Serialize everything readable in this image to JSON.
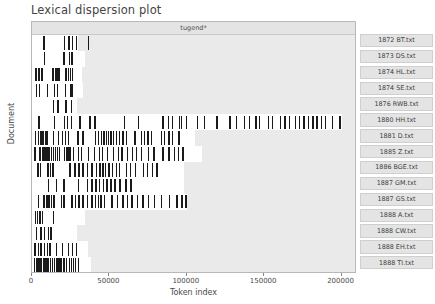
{
  "title": "Lexical dispersion plot",
  "facet": {
    "label": "tugend*"
  },
  "axes": {
    "x_label": "Token index",
    "y_label": "Document",
    "x_ticks": [
      {
        "value": 0,
        "label": "0"
      },
      {
        "value": 50000,
        "label": "50000"
      },
      {
        "value": 100000,
        "label": "100000"
      },
      {
        "value": 150000,
        "label": "150000"
      },
      {
        "value": 200000,
        "label": "200000"
      }
    ],
    "x_min": 0,
    "x_max": 210000
  },
  "colors": {
    "tick": "#1a1a1a",
    "band": "#eaeaea",
    "strip": "#e4e4e4",
    "frame": "#b8b8b8",
    "text": "#4a4a4a"
  },
  "chart_data": {
    "type": "scatter",
    "title": "Lexical dispersion plot",
    "xlabel": "Token index",
    "ylabel": "Document",
    "legend": "tugend*",
    "xlim": [
      0,
      210000
    ],
    "grid": false,
    "series": [
      {
        "name": "1872 BT.txt",
        "length": 30000,
        "count": 6,
        "positions": [
          7200,
          20400,
          23400,
          25600,
          28200,
          36000
        ]
      },
      {
        "name": "1873 DS.txt",
        "length": 34000,
        "count": 4,
        "positions": [
          7500,
          20200,
          23700,
          25400
        ]
      },
      {
        "name": "1874 HL.txt",
        "length": 32000,
        "count": 12,
        "positions": [
          2200,
          4100,
          6000,
          13200,
          14600,
          15400,
          16300,
          17200,
          21400,
          23100,
          24400,
          25600
        ]
      },
      {
        "name": "1874 SE.txt",
        "length": 33000,
        "count": 8,
        "positions": [
          2400,
          4200,
          9400,
          13900,
          16100,
          21200,
          24500,
          25500
        ]
      },
      {
        "name": "1876 RWB.txt",
        "length": 29000,
        "count": 4,
        "positions": [
          13400,
          16400,
          21600,
          25200
        ]
      },
      {
        "name": "1880 HH.txt",
        "length": 200000,
        "count": 40,
        "positions": [
          4100,
          14200,
          20400,
          22600,
          25100,
          30600,
          37100,
          40200,
          59500,
          68500,
          84200,
          87800,
          90400,
          94800,
          96200,
          99400,
          106500,
          111100,
          119000,
          127600,
          131800,
          136800,
          139900,
          144200,
          146500,
          152300,
          155000,
          160200,
          163100,
          166000,
          169800,
          172400,
          175300,
          178200,
          181100,
          183800,
          186500,
          189200,
          193600,
          198500
        ]
      },
      {
        "name": "1881 D.txt",
        "length": 105000,
        "count": 36,
        "positions": [
          1800,
          3600,
          5000,
          6100,
          7000,
          8200,
          9300,
          13400,
          16800,
          19200,
          21000,
          23100,
          29200,
          32600,
          40600,
          42400,
          44300,
          46000,
          47600,
          49100,
          50600,
          52200,
          54000,
          56000,
          58400,
          60800,
          66200,
          70200,
          72400,
          74600,
          76800,
          83400,
          85200,
          88000,
          90300,
          94600
        ]
      },
      {
        "name": "1885 Z.txt",
        "length": 110000,
        "count": 38,
        "positions": [
          1600,
          4600,
          6200,
          7400,
          8600,
          9800,
          11000,
          12200,
          13400,
          14600,
          16000,
          17400,
          20600,
          22200,
          23400,
          24600,
          26200,
          29400,
          31600,
          36200,
          40000,
          43200,
          45000,
          48400,
          52200,
          55400,
          57600,
          61400,
          64600,
          67200,
          70400,
          75000,
          78400,
          84200,
          88000,
          91600,
          94400,
          97200
        ]
      },
      {
        "name": "1886 BGE.txt",
        "length": 98000,
        "count": 26,
        "positions": [
          3400,
          5100,
          9800,
          11400,
          13200,
          24200,
          27400,
          29800,
          32600,
          35600,
          38400,
          41200,
          43600,
          45400,
          47200,
          49400,
          51600,
          54200,
          56200,
          60800,
          63200,
          66400,
          71600,
          74200,
          77400,
          80200
        ]
      },
      {
        "name": "1887 GM.txt",
        "length": 98000,
        "count": 15,
        "positions": [
          10400,
          15400,
          20200,
          29600,
          35400,
          38400,
          40800,
          43200,
          45600,
          48000,
          50600,
          53200,
          56400,
          60200,
          63400
        ]
      },
      {
        "name": "1887 GS.txt",
        "length": 100000,
        "count": 32,
        "positions": [
          3600,
          7400,
          9200,
          10600,
          12200,
          13800,
          18600,
          20200,
          25400,
          27600,
          29800,
          32400,
          35600,
          38200,
          40600,
          42400,
          44200,
          46400,
          51200,
          54600,
          58400,
          61400,
          64200,
          67600,
          71200,
          74800,
          78600,
          83400,
          88200,
          93200,
          96400,
          99000
        ]
      },
      {
        "name": "1888 A.txt",
        "length": 34000,
        "count": 5,
        "positions": [
          1800,
          3200,
          4600,
          6200,
          13400
        ]
      },
      {
        "name": "1888 CW.txt",
        "length": 29000,
        "count": 5,
        "positions": [
          2600,
          5400,
          7600,
          10400,
          11800
        ]
      },
      {
        "name": "1888 EH.txt",
        "length": 36000,
        "count": 11,
        "positions": [
          1600,
          3600,
          5400,
          7600,
          9400,
          11200,
          15400,
          19400,
          23200,
          25600,
          28400
        ]
      },
      {
        "name": "1888 TI.txt",
        "length": 38000,
        "count": 22,
        "positions": [
          1200,
          2400,
          3400,
          4600,
          5600,
          6800,
          8000,
          9200,
          10400,
          11400,
          12600,
          14200,
          15600,
          17000,
          18400,
          20200,
          22000,
          23600,
          25000,
          26400,
          27800,
          29600
        ]
      }
    ]
  }
}
